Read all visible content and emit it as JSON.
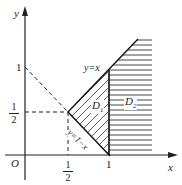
{
  "diagram": {
    "axes": {
      "x_label": "x",
      "y_label": "y",
      "origin": "O"
    },
    "ticks": {
      "y_one": "1",
      "y_half": {
        "num": "1",
        "den": "2"
      },
      "x_half": {
        "num": "1",
        "den": "2"
      },
      "x_one": "1"
    },
    "lines": {
      "y_eq_x": "y=x",
      "y_eq_1_minus_x": "y=1−x"
    },
    "regions": {
      "d1": "D",
      "d1_sub": "1",
      "d2": "D",
      "d2_sub": "2"
    }
  }
}
